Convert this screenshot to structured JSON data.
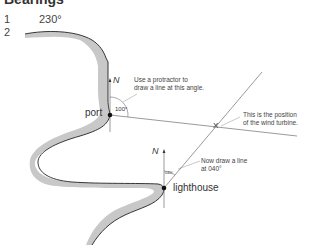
{
  "title": "Bearings",
  "questions": [
    {
      "number": "1",
      "answer": "230°"
    },
    {
      "number": "2",
      "answer": ""
    }
  ],
  "diagram": {
    "places": {
      "port": "port",
      "lighthouse": "lighthouse"
    },
    "north_label": "N",
    "angles": {
      "port_bearing": "100°",
      "lighthouse_bearing": "040°"
    },
    "annotations": {
      "protractor_line1": "Use a protractor to",
      "protractor_line2": "draw a line at this angle.",
      "turbine_line1": "This is the position",
      "turbine_line2": "of the wind turbine.",
      "draw_line1": "Now draw a line",
      "draw_line2": "at 040°"
    },
    "intersection_mark": "X",
    "colors": {
      "coast_fill": "#c8c8c8",
      "coast_line": "#222222",
      "lines": "#555555"
    }
  }
}
